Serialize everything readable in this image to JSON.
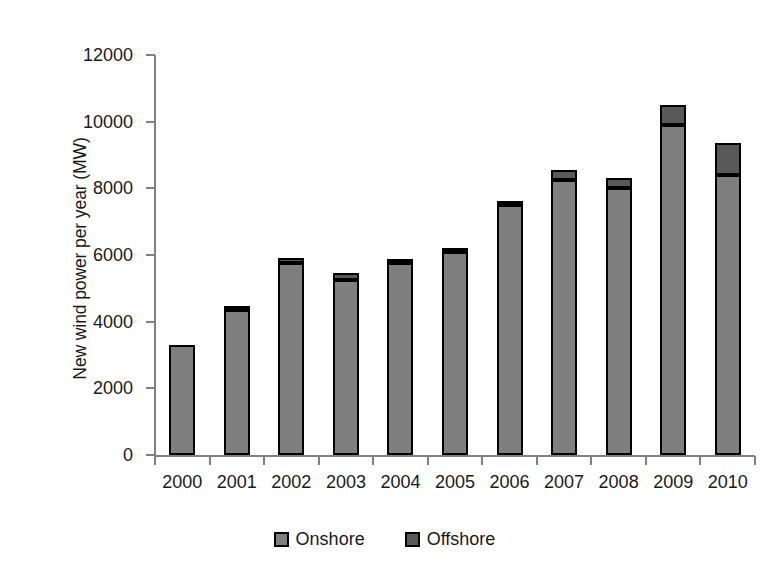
{
  "chart_data": {
    "type": "bar",
    "stacked": true,
    "title": "",
    "xlabel": "",
    "ylabel": "New wind power per year (MW)",
    "ylim": [
      0,
      12000
    ],
    "ytick_labels": [
      "12000",
      "10000",
      "8000",
      "6000",
      "4000",
      "2000",
      "0"
    ],
    "yticks": [
      12000,
      10000,
      8000,
      6000,
      4000,
      2000,
      0
    ],
    "grid": false,
    "legend_position": "bottom",
    "categories": [
      "2000",
      "2001",
      "2002",
      "2003",
      "2004",
      "2005",
      "2006",
      "2007",
      "2008",
      "2009",
      "2010"
    ],
    "series": [
      {
        "name": "Onshore",
        "color": "#7f7f7f",
        "values": [
          3300,
          4350,
          5750,
          5250,
          5750,
          6100,
          7500,
          8250,
          8000,
          9900,
          8400
        ]
      },
      {
        "name": "Offshore",
        "color": "#595959",
        "values": [
          0,
          50,
          150,
          200,
          100,
          100,
          100,
          300,
          300,
          600,
          950
        ]
      }
    ],
    "totals": [
      3300,
      4400,
      5900,
      5450,
      5850,
      6200,
      7600,
      8550,
      8300,
      10500,
      9350
    ]
  },
  "legend": {
    "entries": [
      {
        "label": "Onshore",
        "swatch": "onshore-swatch"
      },
      {
        "label": "Offshore",
        "swatch": "offshore-swatch"
      }
    ]
  },
  "colors": {
    "onshore": "#7f7f7f",
    "offshore": "#595959",
    "axis": "#808080",
    "bar_outline": "#000000",
    "text": "#1a1a1a",
    "background": "#ffffff"
  }
}
